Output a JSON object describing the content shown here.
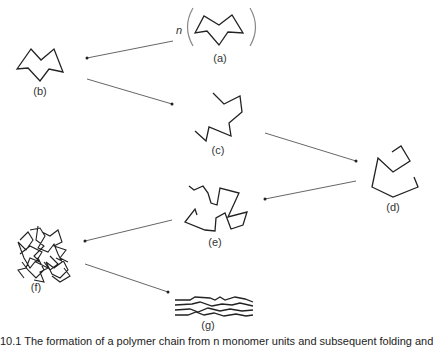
{
  "figure": {
    "multiplier_label": "n",
    "panels": [
      {
        "id": "a",
        "label": "(a)",
        "description": "single monomer unit in parentheses, repeated n times"
      },
      {
        "id": "b",
        "label": "(b)",
        "description": "monomer unit"
      },
      {
        "id": "c",
        "label": "(c)",
        "description": "short zigzag chain"
      },
      {
        "id": "d",
        "label": "(d)",
        "description": "longer folded chain"
      },
      {
        "id": "e",
        "label": "(e)",
        "description": "tangled chain"
      },
      {
        "id": "f",
        "label": "(f)",
        "description": "highly entangled polymer mass"
      },
      {
        "id": "g",
        "label": "(g)",
        "description": "aligned parallel polymer chains"
      }
    ],
    "arrows": [
      {
        "from": "a",
        "to": "b"
      },
      {
        "from": "b",
        "to": "c"
      },
      {
        "from": "c",
        "to": "d"
      },
      {
        "from": "d",
        "to": "e"
      },
      {
        "from": "e",
        "to": "f"
      },
      {
        "from": "f",
        "to": "g"
      }
    ],
    "colors": {
      "stroke": "#222222",
      "arrow": "#555555",
      "paren": "#888888",
      "text": "#333333"
    }
  },
  "caption": {
    "text": "10.1 The formation of a polymer chain from n monomer units and subsequent folding and alignment"
  }
}
